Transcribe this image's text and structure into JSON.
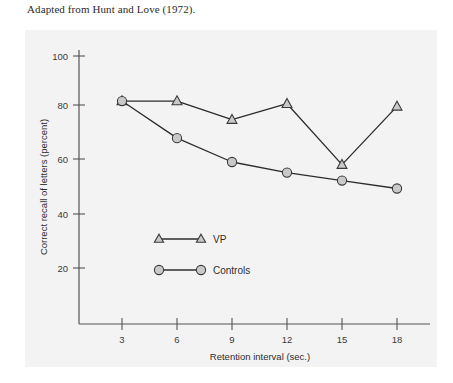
{
  "caption": "Adapted from Hunt and Love (1972).",
  "chart_data": {
    "type": "line",
    "title": "",
    "xlabel": "Retention interval (sec.)",
    "ylabel": "Correct recall of letters (percent)",
    "x": [
      3,
      6,
      9,
      12,
      15,
      18
    ],
    "xticks": [
      "3",
      "6",
      "9",
      "12",
      "15",
      "18"
    ],
    "yticks": [
      "20",
      "40",
      "60",
      "80",
      "100"
    ],
    "xlim": [
      0,
      20
    ],
    "ylim": [
      0,
      110
    ],
    "grid": false,
    "legend_position": "inside-lower-left",
    "series": [
      {
        "name": "VP",
        "marker": "triangle",
        "values": [
          83,
          83,
          76,
          82,
          59,
          81
        ]
      },
      {
        "name": "Controls",
        "marker": "circle",
        "values": [
          83,
          69,
          60,
          56,
          53,
          50
        ]
      }
    ]
  },
  "colors": {
    "panel_background": "#f3f3f3",
    "line": "#2c2c30",
    "marker_fill": "#c9c9c9",
    "marker_stroke": "#3a3a3c",
    "axis": "#55555a",
    "text": "#2e2e2e"
  }
}
